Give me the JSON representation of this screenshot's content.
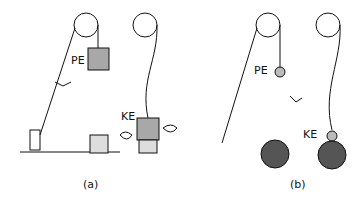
{
  "panels": [
    {
      "caption": "(a)",
      "pe_label": "PE",
      "ke_label": "KE"
    },
    {
      "caption": "(b)",
      "pe_label": "PE",
      "ke_label": "KE"
    }
  ],
  "colors": {
    "block": "#a8a8a8",
    "ball": "#555555",
    "small_ball": "#bbbbbb",
    "line": "#111111"
  }
}
